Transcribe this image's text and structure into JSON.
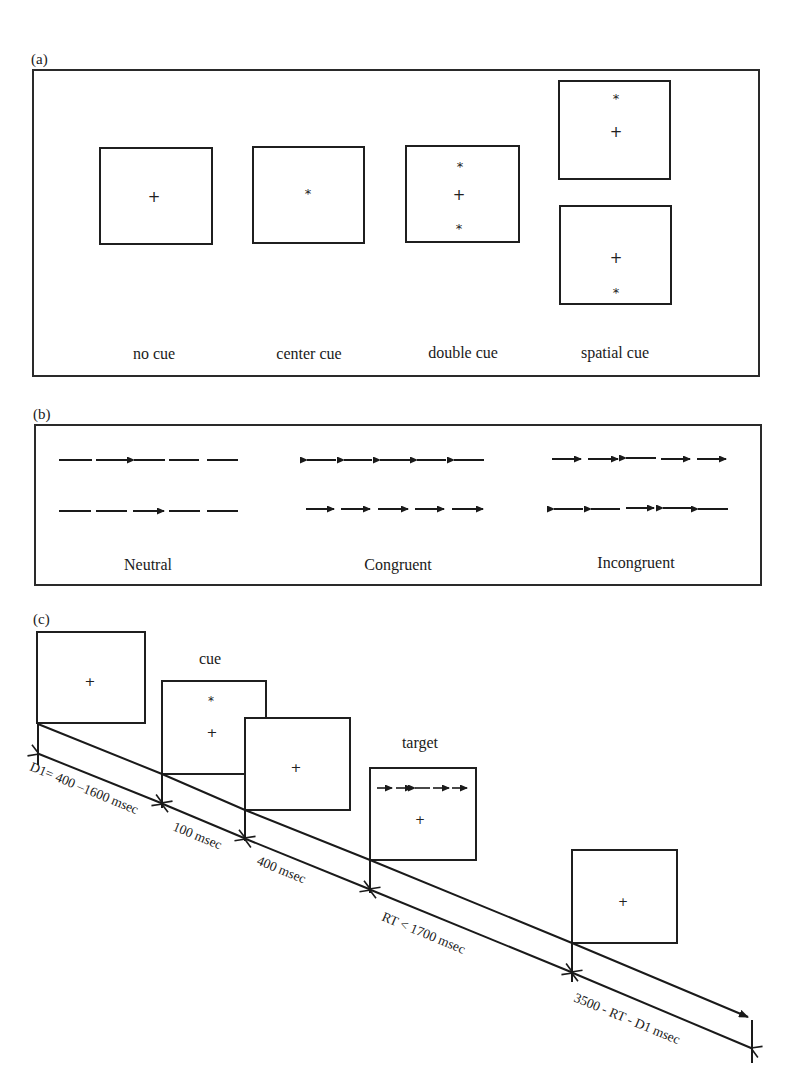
{
  "figure": {
    "panels": [
      {
        "id": "a",
        "label": "(a)",
        "cue_types": [
          {
            "name": "no cue",
            "symbols": [
              "+"
            ]
          },
          {
            "name": "center cue",
            "symbols": [
              "*"
            ]
          },
          {
            "name": "double cue",
            "symbols": [
              "*",
              "+",
              "*"
            ]
          },
          {
            "name": "spatial cue",
            "frames": [
              [
                "*",
                "+"
              ],
              [
                "+",
                "*"
              ]
            ]
          }
        ]
      },
      {
        "id": "b",
        "label": "(b)",
        "flanker_types": [
          {
            "name": "Neutral",
            "rows": [
              "— — ← — —",
              "— — → — —"
            ]
          },
          {
            "name": "Congruent",
            "rows": [
              "← ← ← ← ←",
              "→ → → → →"
            ]
          },
          {
            "name": "Incongruent",
            "rows": [
              "→ → ← → →",
              "← ← → ← ←"
            ]
          }
        ]
      },
      {
        "id": "c",
        "label": "(c)",
        "stage_labels": {
          "cue": "cue",
          "target": "target"
        },
        "fixation": "+",
        "cue_symbol": "*",
        "target_arrows": "→ → ← → →",
        "durations": [
          "D1= 400 –1600 msec",
          "100 msec",
          "400 msec",
          "RT < 1700 msec",
          "3500 - RT - D1 msec"
        ]
      }
    ]
  }
}
